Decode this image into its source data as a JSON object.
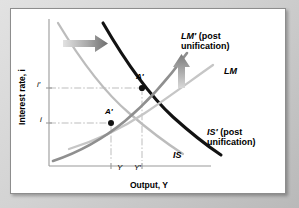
{
  "figure": {
    "kind": "is-lm-diagram",
    "axes": {
      "ylabel": "Interest rate, i",
      "xlabel": "Output, Y",
      "y_ticks": [
        "i′",
        "i"
      ],
      "x_ticks": [
        "Y",
        "Y′"
      ]
    },
    "colors": {
      "is_shifted": "#111111",
      "is_original": "#b0b0b0",
      "lm_shifted": "#8f8f8f",
      "lm_original": "#c2c2c2",
      "guide": "#b5b5b5",
      "axis": "#9a9a9a",
      "arrow": "#909090",
      "panel": "#ffffff",
      "matte": "#d2d2d2"
    },
    "curves": [
      {
        "id": "lm-shifted",
        "label_line1": "LM′",
        "label_line2": "(post",
        "label_line3": "unification)",
        "style": "dark-gray-thick"
      },
      {
        "id": "lm-original",
        "label_line1": "LM",
        "style": "light-gray"
      },
      {
        "id": "is-shifted",
        "label_line1": "IS′",
        "label_line2": "(post",
        "label_line3": "unification)",
        "style": "black-thick"
      },
      {
        "id": "is-original",
        "label_line1": "IS",
        "style": "light-gray"
      }
    ],
    "labels": {
      "lm_shifted_l1": "LM′",
      "lm_shifted_l2": " (post",
      "lm_shifted_l3": "unification)",
      "lm_original": "LM",
      "is_shifted_l1": "IS′",
      "is_shifted_l2": " (post",
      "is_shifted_l3": "unification)",
      "is_original": "IS"
    },
    "points": [
      {
        "id": "equilibrium-new",
        "label": "A′",
        "x": "Y′",
        "y": "i′"
      },
      {
        "id": "equilibrium-old",
        "label": "A′",
        "x": "Y",
        "y": "i"
      }
    ],
    "annotations": [
      {
        "id": "is-shift-arrow",
        "direction": "right",
        "meaning": "IS shifts right"
      },
      {
        "id": "lm-shift-arrow",
        "direction": "up",
        "meaning": "LM shifts up"
      }
    ]
  }
}
